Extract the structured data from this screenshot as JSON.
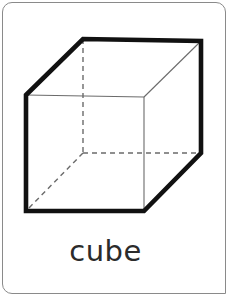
{
  "card": {
    "background_color": "#ffffff",
    "border_color": "#8a8a8a",
    "corner_radius_px": 10
  },
  "figure": {
    "name": "cube",
    "kind": "wireframe-3d-solid",
    "stroke_colors": {
      "silhouette": "#111111",
      "interior_edge": "#6b6b6b",
      "hidden_edge": "#6b6b6b"
    },
    "stroke_widths": {
      "silhouette": 4.6,
      "interior_edge": 1.1,
      "hidden_edge": 1.4
    },
    "hidden_edge_dash": "5,4",
    "vertices": {
      "front_top_left": [
        23,
        92
      ],
      "front_top_right": [
        141,
        94
      ],
      "front_bottom_right": [
        141,
        208
      ],
      "front_bottom_left": [
        23,
        208
      ],
      "back_top_left": [
        80,
        36
      ],
      "back_top_right": [
        198,
        38
      ],
      "back_bottom_right": [
        198,
        150
      ],
      "back_bottom_left": [
        80,
        150
      ]
    },
    "silhouette_path": "M 23 92 L 80 36 L 198 38 L 198 150 L 141 208 L 23 208 Z",
    "visible_interior_edges": [
      {
        "name": "front-top-edge",
        "from": "front_top_left",
        "to": "front_top_right"
      },
      {
        "name": "front-right-edge",
        "from": "front_top_right",
        "to": "front_bottom_right"
      },
      {
        "name": "top-right-diagonal",
        "from": "front_top_right",
        "to": "back_top_right"
      }
    ],
    "hidden_edges": [
      {
        "name": "back-left-vertical",
        "from": "back_top_left",
        "to": "back_bottom_left"
      },
      {
        "name": "back-bottom-edge",
        "from": "back_bottom_left",
        "to": "back_bottom_right"
      },
      {
        "name": "bottom-left-diagonal",
        "from": "back_bottom_left",
        "to": "front_bottom_left"
      }
    ]
  },
  "label": {
    "text": "cube",
    "color": "#2b2b2b"
  }
}
